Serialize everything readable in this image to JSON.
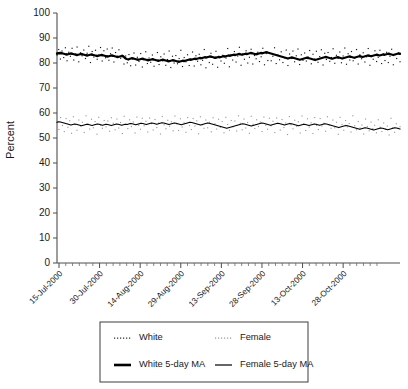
{
  "chart_data": {
    "type": "line",
    "title": "",
    "xlabel": "",
    "ylabel": "Percent",
    "ylim": [
      0,
      100
    ],
    "ytick_step": 10,
    "ytick_labels": [
      "0",
      "10",
      "20",
      "30",
      "40",
      "50",
      "60",
      "70",
      "80",
      "90",
      "100"
    ],
    "grid": false,
    "legend_position": "bottom",
    "x_axis": {
      "tick_labels": [
        "15-Jul-2000",
        "30-Jul-2000",
        "14-Aug-2000",
        "29-Aug-2000",
        "13-Sep-2000",
        "28-Sep-2000",
        "13-Oct-2000",
        "28-Oct-2000"
      ],
      "minor_ticks_between": 5,
      "start_date": "15-Jul-2000",
      "end_date": "28-Oct-2000"
    },
    "series": [
      {
        "name": "White",
        "style": "scatter-dotted",
        "color": "#111111",
        "values": [
          83.2,
          85.4,
          81.6,
          84.8,
          82.2,
          86.1,
          80.9,
          84.3,
          82.7,
          85.9,
          81.2,
          83.6,
          86.4,
          80.5,
          84.1,
          82.9,
          85.2,
          81.8,
          83.9,
          86.7,
          80.2,
          84.6,
          82.4,
          85.1,
          81.5,
          83.3,
          86.2,
          80.8,
          84.9,
          82.1,
          85.6,
          81.1,
          83.7,
          86.0,
          80.4,
          84.2,
          82.6,
          85.3,
          81.9,
          83.1,
          79.6,
          82.8,
          80.1,
          83.4,
          78.9,
          81.7,
          84.0,
          79.2,
          82.3,
          80.6,
          83.8,
          78.4,
          81.3,
          84.5,
          79.8,
          82.0,
          80.3,
          83.2,
          78.7,
          81.0,
          84.2,
          79.4,
          82.5,
          80.9,
          83.6,
          79.1,
          81.4,
          84.8,
          78.2,
          82.7,
          80.0,
          83.0,
          79.7,
          81.8,
          85.1,
          78.6,
          82.2,
          80.5,
          83.3,
          79.0,
          81.6,
          84.4,
          78.8,
          82.9,
          80.7,
          83.5,
          79.3,
          81.1,
          85.4,
          78.1,
          82.4,
          80.2,
          83.9,
          79.5,
          81.9,
          84.7,
          78.3,
          82.6,
          80.8,
          83.1,
          79.9,
          82.0,
          85.8,
          78.5,
          83.4,
          81.2,
          84.6,
          80.4,
          82.8,
          86.3,
          79.1,
          83.7,
          81.5,
          84.9,
          80.0,
          82.3,
          85.5,
          79.6,
          83.0,
          81.7,
          84.3,
          80.6,
          82.5,
          85.9,
          79.3,
          83.8,
          81.0,
          84.1,
          80.9,
          82.7,
          86.1,
          79.8,
          83.2,
          81.3,
          84.5,
          80.2,
          82.1,
          85.2,
          79.0,
          83.6,
          81.8,
          84.8,
          80.5,
          82.9,
          85.6,
          79.4,
          83.3,
          81.1,
          84.0,
          80.8,
          82.4,
          85.0,
          79.7,
          83.5,
          81.6,
          84.7,
          80.3,
          82.6,
          85.3,
          79.2,
          83.9,
          81.4,
          84.2,
          80.7,
          82.2,
          85.7,
          79.9,
          83.1,
          81.9,
          84.4,
          80.1,
          82.8,
          86.0,
          79.5,
          83.7,
          81.2,
          84.6,
          80.9,
          82.0,
          85.4,
          79.6,
          83.3,
          81.7,
          84.1,
          80.4,
          82.5,
          85.8,
          79.1,
          83.0,
          81.5,
          84.9,
          80.6,
          82.3,
          85.1,
          79.8,
          83.6,
          81.0,
          84.3,
          80.2,
          82.7,
          85.5,
          79.3,
          83.4,
          81.8,
          84.0,
          80.5
        ]
      },
      {
        "name": "Female",
        "style": "scatter-dotted",
        "color": "#9a9a9a",
        "values": [
          56.1,
          53.4,
          58.2,
          55.0,
          52.6,
          57.8,
          54.3,
          56.9,
          51.9,
          58.5,
          55.4,
          53.1,
          57.2,
          54.8,
          56.3,
          52.2,
          58.9,
          55.7,
          53.6,
          57.5,
          54.1,
          56.6,
          51.5,
          58.3,
          55.2,
          53.9,
          57.0,
          54.5,
          56.8,
          52.7,
          58.1,
          55.9,
          53.3,
          57.6,
          54.0,
          56.2,
          51.8,
          58.7,
          55.5,
          53.8,
          57.3,
          54.6,
          56.4,
          52.0,
          58.4,
          55.1,
          53.5,
          57.9,
          54.9,
          56.7,
          52.4,
          58.0,
          55.8,
          53.2,
          57.4,
          54.2,
          56.0,
          51.6,
          58.6,
          55.3,
          53.7,
          57.1,
          54.7,
          56.5,
          52.9,
          58.8,
          55.6,
          53.0,
          57.7,
          54.4,
          56.1,
          52.3,
          58.2,
          55.0,
          53.4,
          57.8,
          54.8,
          56.9,
          51.7,
          58.5,
          55.2,
          53.9,
          57.2,
          54.1,
          56.3,
          52.5,
          58.1,
          55.7,
          53.6,
          57.5,
          54.3,
          56.6,
          52.1,
          58.3,
          55.4,
          53.1,
          57.0,
          54.5,
          56.8,
          52.8,
          58.9,
          55.9,
          53.3,
          57.6,
          54.0,
          56.2,
          51.9,
          58.7,
          55.5,
          53.8,
          57.3,
          54.6,
          56.4,
          52.6,
          58.4,
          55.1,
          53.5,
          57.9,
          54.9,
          56.7,
          52.2,
          58.0,
          55.8,
          53.2,
          57.4,
          54.2,
          56.0,
          51.4,
          58.6,
          55.3,
          53.7,
          57.1,
          54.7,
          56.5,
          52.0,
          58.8,
          55.6,
          53.0,
          57.7,
          54.4,
          56.1,
          51.8,
          58.2,
          55.0,
          53.4,
          57.8,
          54.8,
          55.9,
          52.7,
          58.5,
          55.2,
          53.9,
          57.2,
          54.1,
          56.3,
          51.5,
          58.3,
          55.4,
          53.1,
          57.0,
          54.5,
          55.8,
          52.4,
          58.9,
          54.9,
          53.3,
          56.6,
          54.0,
          55.2,
          51.6,
          57.6,
          54.6,
          52.9,
          56.4,
          53.8,
          55.1,
          52.1,
          57.3,
          54.3,
          52.6,
          56.0,
          53.5,
          54.8,
          51.2,
          57.9,
          54.1,
          52.3,
          55.7,
          53.9,
          54.5
        ]
      },
      {
        "name": "White 5-day MA",
        "style": "line-thick",
        "color": "#000000",
        "values": [
          83.8,
          83.9,
          84.0,
          83.9,
          83.7,
          83.5,
          83.4,
          83.6,
          83.8,
          83.7,
          83.5,
          83.3,
          83.2,
          83.4,
          83.6,
          83.5,
          83.3,
          83.1,
          83.0,
          83.2,
          83.4,
          83.3,
          83.1,
          82.9,
          82.8,
          83.0,
          83.2,
          83.1,
          82.9,
          82.7,
          82.6,
          82.8,
          83.0,
          82.9,
          82.7,
          82.5,
          82.4,
          82.6,
          82.8,
          82.7,
          82.0,
          81.6,
          81.4,
          81.7,
          81.9,
          81.8,
          81.6,
          81.4,
          81.3,
          81.5,
          81.7,
          81.6,
          81.4,
          81.2,
          81.1,
          81.3,
          81.5,
          81.4,
          81.2,
          81.0,
          80.9,
          81.1,
          81.3,
          81.2,
          81.0,
          80.8,
          80.7,
          80.9,
          81.1,
          81.0,
          80.8,
          80.6,
          80.5,
          80.7,
          80.9,
          80.8,
          81.0,
          81.2,
          81.4,
          81.3,
          81.5,
          81.7,
          81.6,
          81.8,
          82.0,
          81.9,
          82.1,
          82.3,
          82.2,
          82.4,
          82.6,
          82.5,
          82.3,
          82.1,
          82.2,
          82.4,
          82.3,
          82.5,
          82.7,
          82.6,
          82.8,
          83.0,
          82.9,
          83.1,
          83.3,
          83.2,
          83.4,
          83.6,
          83.5,
          83.3,
          83.5,
          83.7,
          83.6,
          83.8,
          84.0,
          83.9,
          83.7,
          83.5,
          83.6,
          83.8,
          84.0,
          83.9,
          84.1,
          84.3,
          84.2,
          84.0,
          83.8,
          83.6,
          83.4,
          83.2,
          83.0,
          82.8,
          82.6,
          82.4,
          82.2,
          82.0,
          81.8,
          82.0,
          82.2,
          82.1,
          81.9,
          81.7,
          81.5,
          81.3,
          81.5,
          81.7,
          81.9,
          82.1,
          82.0,
          81.8,
          81.6,
          81.4,
          81.2,
          81.4,
          81.6,
          81.8,
          82.0,
          82.2,
          82.4,
          82.3,
          82.1,
          81.9,
          81.7,
          81.9,
          82.1,
          82.3,
          82.2,
          82.0,
          81.8,
          82.0,
          82.2,
          82.4,
          82.6,
          82.5,
          82.3,
          82.1,
          82.3,
          82.5,
          82.7,
          82.6,
          82.4,
          82.6,
          82.8,
          83.0,
          82.9,
          82.7,
          82.9,
          83.1,
          83.3,
          83.2,
          83.0,
          83.2,
          83.4,
          83.3,
          83.5,
          83.7,
          83.6,
          83.4,
          83.2,
          83.4,
          83.6,
          83.8,
          83.7
        ]
      },
      {
        "name": "Female 5-day MA",
        "style": "line-thin",
        "color": "#000000",
        "values": [
          56.3,
          56.5,
          56.4,
          56.2,
          56.0,
          55.8,
          55.6,
          55.4,
          55.2,
          55.4,
          55.6,
          55.5,
          55.3,
          55.1,
          54.9,
          55.1,
          55.3,
          55.5,
          55.4,
          55.2,
          55.0,
          55.2,
          55.4,
          55.6,
          55.5,
          55.3,
          55.1,
          55.3,
          55.5,
          55.4,
          55.2,
          55.0,
          55.2,
          55.4,
          55.6,
          55.5,
          55.3,
          55.1,
          55.3,
          55.5,
          55.4,
          55.6,
          55.8,
          55.7,
          55.5,
          55.3,
          55.5,
          55.7,
          55.9,
          55.8,
          55.6,
          55.4,
          55.6,
          55.8,
          56.0,
          55.9,
          55.7,
          55.5,
          55.7,
          55.9,
          56.1,
          56.0,
          55.8,
          55.6,
          55.4,
          55.6,
          55.8,
          56.0,
          55.9,
          55.7,
          55.5,
          55.3,
          55.5,
          55.7,
          55.9,
          56.1,
          56.3,
          56.2,
          56.0,
          55.8,
          55.6,
          55.4,
          55.2,
          55.4,
          55.6,
          55.8,
          56.0,
          55.9,
          55.7,
          55.5,
          55.3,
          55.1,
          54.9,
          54.7,
          54.5,
          54.3,
          54.1,
          53.9,
          54.1,
          54.3,
          54.5,
          54.7,
          54.9,
          55.1,
          55.3,
          55.5,
          55.7,
          55.6,
          55.4,
          55.2,
          55.0,
          54.8,
          55.0,
          55.2,
          55.4,
          55.6,
          55.8,
          56.0,
          55.9,
          55.7,
          55.5,
          55.3,
          55.1,
          55.3,
          55.5,
          55.7,
          55.9,
          55.8,
          55.6,
          55.4,
          55.2,
          55.4,
          55.6,
          55.8,
          55.7,
          55.5,
          55.3,
          55.1,
          54.9,
          55.1,
          55.3,
          55.5,
          55.4,
          55.2,
          55.0,
          55.2,
          55.4,
          55.6,
          55.5,
          55.3,
          55.1,
          55.3,
          55.5,
          55.7,
          55.6,
          55.4,
          55.2,
          55.0,
          54.8,
          54.6,
          54.4,
          54.2,
          54.4,
          54.6,
          54.8,
          55.0,
          54.9,
          54.7,
          54.5,
          54.3,
          54.1,
          53.9,
          53.7,
          53.5,
          53.7,
          53.9,
          54.1,
          54.0,
          53.8,
          53.6,
          53.4,
          53.2,
          53.4,
          53.6,
          53.8,
          54.0,
          53.9,
          53.7,
          53.5,
          53.3,
          53.5,
          53.7,
          53.9,
          54.1,
          54.0,
          53.8,
          53.6
        ]
      }
    ],
    "legend": [
      {
        "label": "White",
        "style": "dotted-dark"
      },
      {
        "label": "Female",
        "style": "dotted-light"
      },
      {
        "label": "White 5-day MA",
        "style": "solid-thick"
      },
      {
        "label": "Female 5-day MA",
        "style": "solid-thin"
      }
    ]
  }
}
